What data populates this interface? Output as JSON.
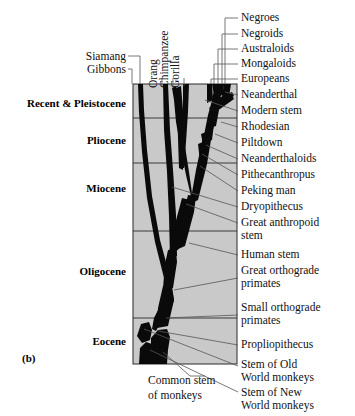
{
  "figure": {
    "panel_tag": "(b)",
    "box": {
      "x": 133,
      "y": 84,
      "width": 104,
      "height": 280,
      "fill": "#c9c9c9",
      "stroke": "#2a2a2a"
    },
    "colors": {
      "tree": "#0a0a0a",
      "leader": "#4a4a4a",
      "background": "#ffffff",
      "panel_fill": "#c9c9c9"
    }
  },
  "epochs": [
    {
      "label": "Recent & Pleistocene",
      "x": 8,
      "y": 97,
      "w": 118,
      "boundary_y": 118
    },
    {
      "label": "Pliocene",
      "x": 8,
      "y": 134,
      "w": 118,
      "boundary_y": 163
    },
    {
      "label": "Miocene",
      "x": 8,
      "y": 182,
      "w": 118,
      "boundary_y": 231
    },
    {
      "label": "Oligocene",
      "x": 8,
      "y": 265,
      "w": 118,
      "boundary_y": 318
    },
    {
      "label": "Eocene",
      "x": 8,
      "y": 335,
      "w": 118,
      "boundary_y": 364
    }
  ],
  "top_labels_horizontal": [
    {
      "label": "Siamang",
      "x": 58,
      "y": 56,
      "w": 72,
      "tip_x": 152,
      "tip_y": 84,
      "elbow_x": 140
    },
    {
      "label": "Gibbons",
      "x": 58,
      "y": 69,
      "w": 72,
      "tip_x": 143,
      "tip_y": 84,
      "elbow_x": 132
    }
  ],
  "top_labels_vertical": [
    {
      "label": "Orang",
      "x": 162,
      "y": 76,
      "tip_x": 162,
      "tip_y": 84
    },
    {
      "label": "Chimpanzee",
      "x": 173,
      "y": 76,
      "tip_x": 173,
      "tip_y": 84
    },
    {
      "label": "Gorilla",
      "x": 184,
      "y": 76,
      "tip_x": 184,
      "tip_y": 84
    }
  ],
  "right_labels": [
    {
      "label": "Negroes",
      "x": 241,
      "y": 14,
      "tip_x": 213,
      "tip_y": 84,
      "elbow_x": 219,
      "elbow_y": 20
    },
    {
      "label": "Negroids",
      "x": 241,
      "y": 30,
      "tip_x": 216,
      "tip_y": 84,
      "elbow_x": 223,
      "elbow_y": 36
    },
    {
      "label": "Australoids",
      "x": 241,
      "y": 45,
      "tip_x": 219,
      "tip_y": 84,
      "elbow_x": 227,
      "elbow_y": 51
    },
    {
      "label": "Mongaloids",
      "x": 241,
      "y": 60,
      "tip_x": 223,
      "tip_y": 84,
      "elbow_x": 231,
      "elbow_y": 66
    },
    {
      "label": "Europeans",
      "x": 241,
      "y": 75,
      "tip_x": 228,
      "tip_y": 84,
      "elbow_x": 234,
      "elbow_y": 81
    },
    {
      "label": "Neanderthal",
      "x": 241,
      "y": 91,
      "tip_x": 228,
      "tip_y": 92,
      "elbow_x": 236,
      "elbow_y": 96
    },
    {
      "label": "Modern stem",
      "x": 241,
      "y": 107,
      "tip_x": 207,
      "tip_y": 100,
      "elbow_x": 236,
      "elbow_y": 112
    },
    {
      "label": "Rhodesian",
      "x": 241,
      "y": 123,
      "tip_x": 224,
      "tip_y": 121,
      "elbow_x": 236,
      "elbow_y": 128
    },
    {
      "label": "Piltdown",
      "x": 241,
      "y": 139,
      "tip_x": 221,
      "tip_y": 139,
      "elbow_x": 236,
      "elbow_y": 144
    },
    {
      "label": "Neanderthaloids",
      "x": 241,
      "y": 155,
      "tip_x": 206,
      "tip_y": 147,
      "elbow_x": 236,
      "elbow_y": 160
    },
    {
      "label": "Pithecanthropus",
      "x": 241,
      "y": 171,
      "tip_x": 203,
      "tip_y": 156,
      "elbow_x": 236,
      "elbow_y": 176
    },
    {
      "label": "Peking man",
      "x": 241,
      "y": 187,
      "tip_x": 199,
      "tip_y": 169,
      "elbow_x": 236,
      "elbow_y": 192
    },
    {
      "label": "Dryopithecus",
      "x": 241,
      "y": 203,
      "tip_x": 173,
      "tip_y": 186,
      "elbow_x": 236,
      "elbow_y": 208
    },
    {
      "label": "Great anthropoid",
      "x": 241,
      "y": 219,
      "tip_x": 181,
      "tip_y": 208,
      "elbow_x": 236,
      "elbow_y": 224,
      "label2": "stem"
    },
    {
      "label": "Human stem",
      "x": 241,
      "y": 251,
      "tip_x": 190,
      "tip_y": 243,
      "elbow_x": 236,
      "elbow_y": 256
    },
    {
      "label": "Great orthograde",
      "x": 241,
      "y": 267,
      "tip_x": 175,
      "tip_y": 290,
      "elbow_x": 236,
      "elbow_y": 280,
      "label2": "primates"
    },
    {
      "label": "Small orthograde",
      "x": 241,
      "y": 304,
      "tip_x": 168,
      "tip_y": 317,
      "elbow_x": 236,
      "elbow_y": 317,
      "label2": "primates"
    },
    {
      "label": "Propliopithecus",
      "x": 241,
      "y": 341,
      "tip_x": 160,
      "tip_y": 332,
      "elbow_x": 236,
      "elbow_y": 346
    },
    {
      "label": "Stem of Old",
      "x": 241,
      "y": 361,
      "tip_x": 145,
      "tip_y": 327,
      "elbow_x": 236,
      "elbow_y": 366,
      "label2": "World monkeys"
    },
    {
      "label": "Stem of New",
      "x": 241,
      "y": 390,
      "tip_x": 150,
      "tip_y": 348,
      "elbow_x": 236,
      "elbow_y": 393,
      "label2": "World monkeys"
    }
  ],
  "bottom_label": {
    "line1": "Common stem",
    "line2": "of monkeys",
    "x": 150,
    "y": 376,
    "tip_x": 163,
    "tip_y": 352,
    "elbow_x": 200,
    "elbow_y": 374
  }
}
